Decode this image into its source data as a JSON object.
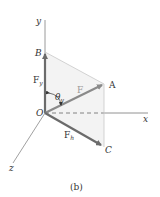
{
  "figure": {
    "caption": "(b)",
    "axes": {
      "x": "x",
      "y": "y",
      "z": "z"
    },
    "points": {
      "origin": "O",
      "A": "A",
      "B": "B",
      "C": "C"
    },
    "vectors": {
      "F": {
        "label": "F"
      },
      "Fy": {
        "label": "F",
        "subscript": "y"
      },
      "Fh": {
        "label": "F",
        "subscript": "h"
      }
    },
    "angle": {
      "symbol": "θ",
      "subscript": "y"
    },
    "colors": {
      "vector": "#6b6b6b",
      "force_F": "#8a8a8a",
      "axis": "#7a7a7a",
      "guide": "#c8c8c8",
      "shade": "#e9e9e9"
    }
  }
}
